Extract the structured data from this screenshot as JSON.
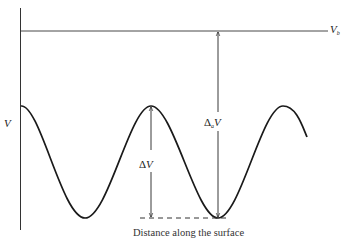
{
  "figure": {
    "labels": {
      "v_b": {
        "main": "V",
        "sub": "b"
      },
      "v_axis": "V",
      "delta_a_v": {
        "delta": "Δ",
        "sub": "a",
        "main": "V"
      },
      "delta_v": {
        "delta": "Δ",
        "main": "V"
      },
      "x_axis": "Distance along the surface"
    },
    "colors": {
      "ink": "#222222",
      "background": "#ffffff"
    }
  }
}
